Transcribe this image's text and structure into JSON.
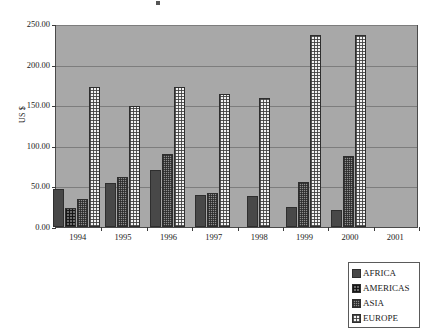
{
  "chart_data": {
    "type": "bar",
    "title": "",
    "xlabel": "",
    "ylabel": "US $",
    "ylim": [
      0,
      250
    ],
    "yticks": [
      "0.00",
      "50.00",
      "100.00",
      "150.00",
      "200.00",
      "250.00"
    ],
    "ytick_values": [
      0,
      50,
      100,
      150,
      200,
      250
    ],
    "grid": true,
    "legend_position": "bottom-right",
    "categories": [
      "1994",
      "1995",
      "1996",
      "1997",
      "1998",
      "1999",
      "2000",
      "2001"
    ],
    "series": [
      {
        "name": "AFRICA",
        "color": "#484848",
        "pattern": "solid-dark",
        "values": [
          47,
          54,
          70,
          39,
          38,
          25,
          21,
          null
        ]
      },
      {
        "name": "AMERICAS",
        "color": "#6b6b6b",
        "pattern": "cross-hatch",
        "values": [
          23,
          null,
          null,
          null,
          null,
          null,
          null,
          null
        ]
      },
      {
        "name": "ASIA",
        "color": "#8e8e8e",
        "pattern": "fine-grid",
        "values": [
          34,
          62,
          90,
          42,
          null,
          55,
          87,
          null
        ]
      },
      {
        "name": "EUROPE",
        "color": "#f2f2f2",
        "pattern": "dotted-light",
        "values": [
          172,
          149,
          173,
          164,
          159,
          236,
          236,
          null
        ]
      }
    ]
  },
  "legend": {
    "items": [
      {
        "label": "AFRICA"
      },
      {
        "label": "AMERICAS"
      },
      {
        "label": "ASIA"
      },
      {
        "label": "EUROPE"
      }
    ]
  },
  "colors": {
    "plot_background": "#a8a8a8",
    "page_background": "#ffffff",
    "gridline": "#7d7d7d",
    "axis": "#3a3a3a"
  }
}
